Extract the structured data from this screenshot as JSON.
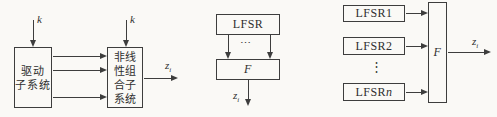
{
  "colors": {
    "line": "#3d3d3d",
    "text": "#2f2f2f",
    "background": "#faf9f6"
  },
  "diagram1": {
    "key_input_left": "k",
    "key_input_right": "k",
    "drive_box": "驱动\n子系统",
    "combiner_box": "非线\n性组\n合子\n系统",
    "output_base": "z",
    "output_sub": "i"
  },
  "diagram2": {
    "lfsr_box": "LFSR",
    "dots": "⋯",
    "f_box": "F",
    "output_base": "z",
    "output_sub": "i"
  },
  "diagram3": {
    "lfsr1_box": "LFSR1",
    "lfsr2_box": "LFSR2",
    "dots": "⋮",
    "lfsrn_base": "LFSR",
    "lfsrn_var": "n",
    "f_box": "F",
    "output_base": "z",
    "output_sub": "i"
  }
}
